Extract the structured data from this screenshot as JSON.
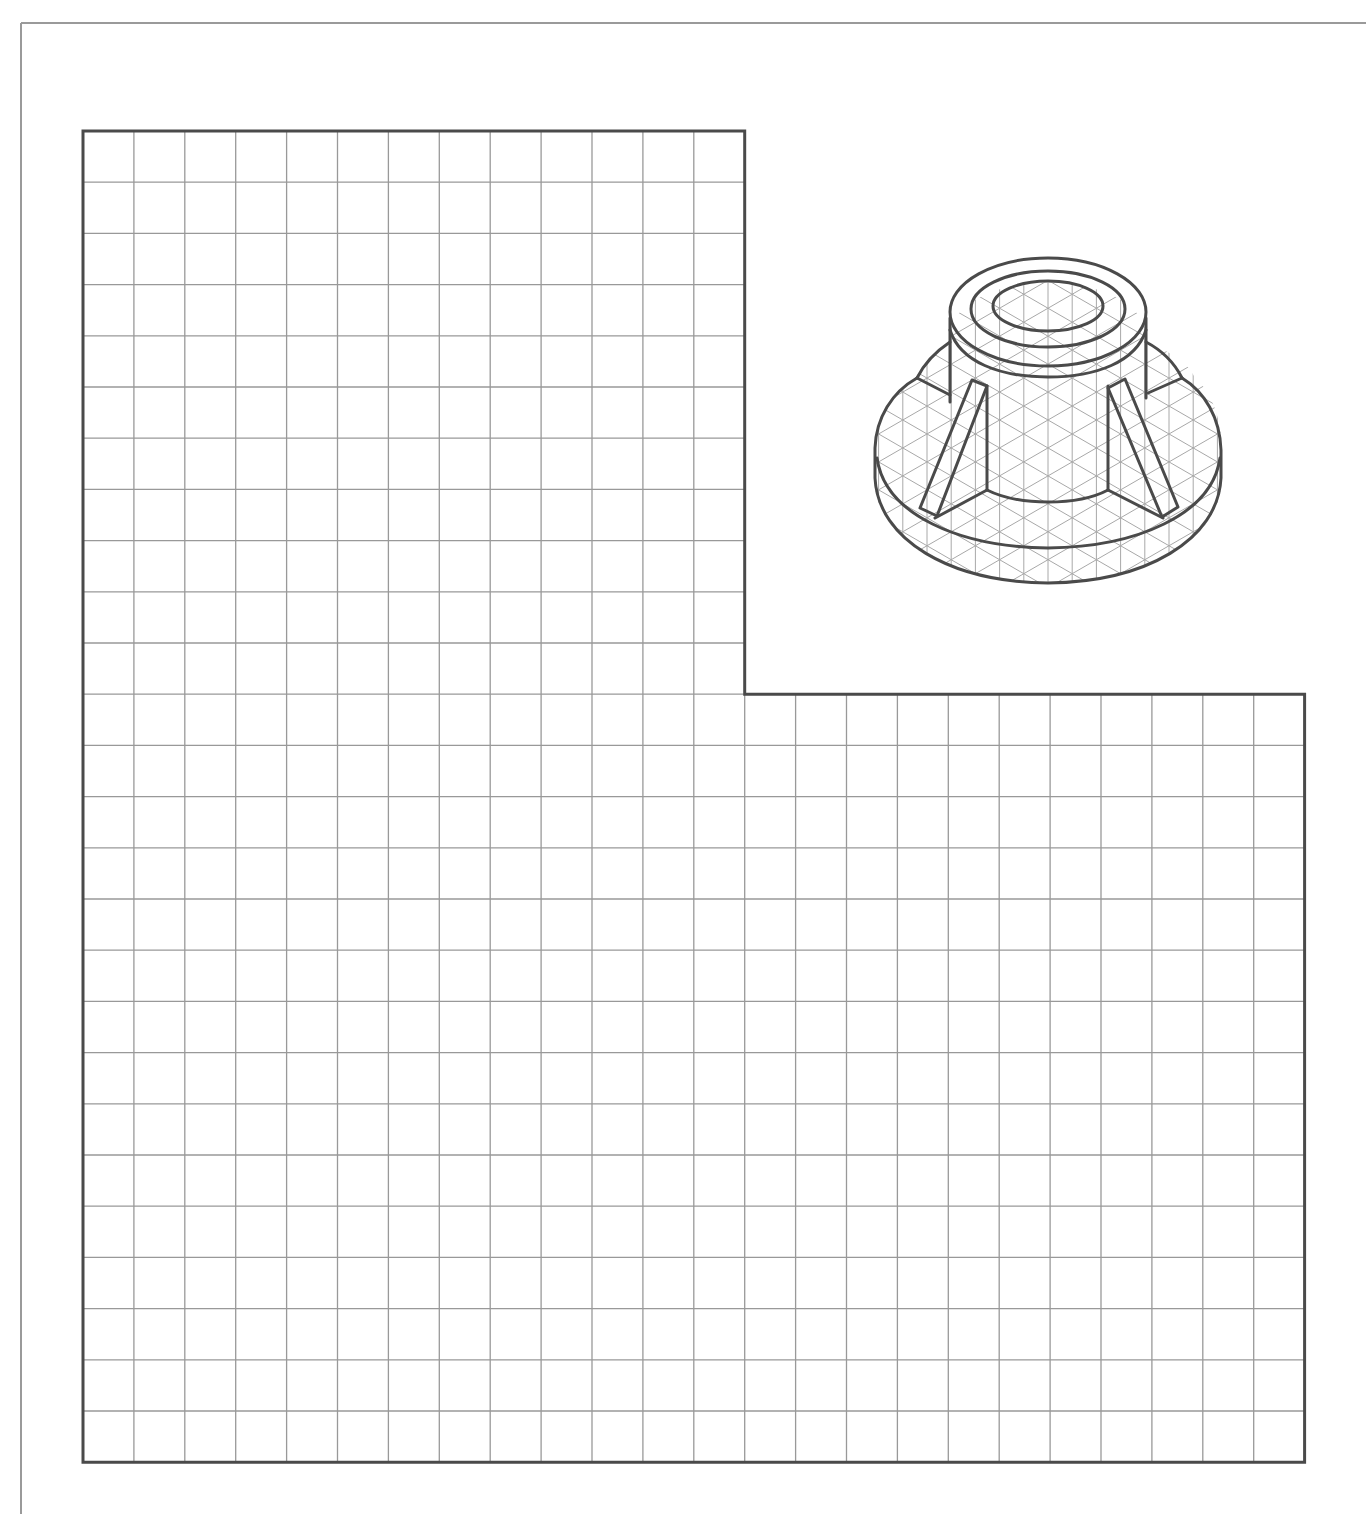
{
  "frame": {
    "left": 21,
    "top": 23,
    "right": 1366,
    "color": "#9a9a9a"
  },
  "grid_area": {
    "origin_x": 83,
    "origin_y": 131,
    "cell_w": 50.9,
    "cell_h": 51.2,
    "upper_cols": 13,
    "total_cols": 24,
    "upper_rows": 11,
    "total_rows": 26,
    "grid_color": "#999999",
    "border_color": "#4a4a4a"
  },
  "pictorial": {
    "label": "isometric-bushing",
    "line_color": "#4a4a4a",
    "iso_grid_color": "#a8a8a8",
    "clip_center": [
      1048,
      420
    ]
  }
}
